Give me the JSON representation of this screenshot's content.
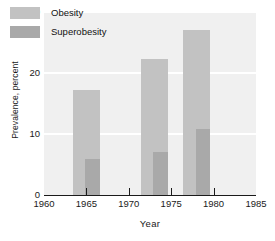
{
  "chart_data": {
    "type": "bar",
    "title": "",
    "subtitle": "",
    "xlabel": "Year",
    "ylabel": "Prevalence, percent",
    "xlim": [
      1960,
      1985
    ],
    "ylim": [
      0,
      30
    ],
    "xticks": [
      "1960",
      "1965",
      "1970",
      "1975",
      "1980",
      "1985"
    ],
    "xtick_values": [
      1960,
      1965,
      1970,
      1975,
      1980,
      1985
    ],
    "yticks": [
      "0",
      "10",
      "20",
      "30"
    ],
    "ytick_values": [
      0,
      10,
      20,
      30
    ],
    "grid": "horizontal-white-gridlines",
    "legend_position": "top-left-inside",
    "stacked": true,
    "x": [
      1965,
      1973,
      1978
    ],
    "bar_width_years": 3.2,
    "series": [
      {
        "name": "Obesity",
        "color": "#c2c2c2",
        "values": [
          17.2,
          22.3,
          27.0
        ]
      },
      {
        "name": "Superobesity",
        "color": "#a9a9a9",
        "values": [
          5.9,
          7.0,
          10.8
        ]
      }
    ],
    "annotations": []
  },
  "legend": {
    "items": [
      {
        "label": "Obesity",
        "color": "#c2c2c2"
      },
      {
        "label": "Superobesity",
        "color": "#a9a9a9"
      }
    ]
  },
  "axes": {
    "y_label": "Prevalence, percent",
    "x_label": "Year"
  }
}
